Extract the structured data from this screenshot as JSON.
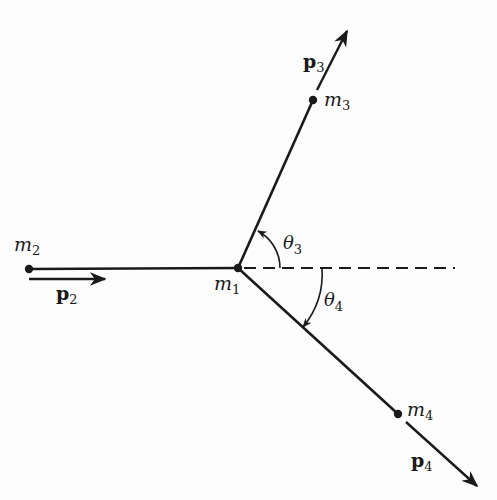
{
  "diagram": {
    "type": "particle-decay-momentum-diagram",
    "colors": {
      "ink": "#1a1a1a",
      "background": "#fdfdfd"
    },
    "particles": [
      {
        "id": "m1",
        "label_base": "m",
        "label_sub": "1",
        "x": 238,
        "y": 268
      },
      {
        "id": "m2",
        "label_base": "m",
        "label_sub": "2",
        "x": 29,
        "y": 269
      },
      {
        "id": "m3",
        "label_base": "m",
        "label_sub": "3",
        "x": 313,
        "y": 100
      },
      {
        "id": "m4",
        "label_base": "m",
        "label_sub": "4",
        "x": 398,
        "y": 414
      }
    ],
    "momenta": [
      {
        "id": "p2",
        "label_base": "p",
        "label_sub": "2"
      },
      {
        "id": "p3",
        "label_base": "p",
        "label_sub": "3"
      },
      {
        "id": "p4",
        "label_base": "p",
        "label_sub": "4"
      }
    ],
    "angles": [
      {
        "id": "theta3",
        "label_base": "θ",
        "label_sub": "3",
        "direction": "counterclockwise from reference line"
      },
      {
        "id": "theta4",
        "label_base": "θ",
        "label_sub": "4",
        "direction": "clockwise from reference line"
      }
    ],
    "reference_line": "dashed horizontal line through m1"
  }
}
